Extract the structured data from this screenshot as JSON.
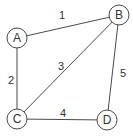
{
  "diagram": {
    "type": "weighted-undirected-graph",
    "stroke_color": "#4a4a4a",
    "node_fill": "#ffffff",
    "nodes": [
      {
        "id": "A",
        "label": "A",
        "x": 17,
        "y": 38
      },
      {
        "id": "B",
        "label": "B",
        "x": 119,
        "y": 15
      },
      {
        "id": "C",
        "label": "C",
        "x": 17,
        "y": 119
      },
      {
        "id": "D",
        "label": "D",
        "x": 107,
        "y": 120
      }
    ],
    "edges": [
      {
        "from": "A",
        "to": "B",
        "weight": "1",
        "label_x": 62,
        "label_y": 19
      },
      {
        "from": "A",
        "to": "C",
        "weight": "2",
        "label_x": 11,
        "label_y": 84
      },
      {
        "from": "B",
        "to": "C",
        "weight": "3",
        "label_x": 61,
        "label_y": 70
      },
      {
        "from": "C",
        "to": "D",
        "weight": "4",
        "label_x": 63,
        "label_y": 117
      },
      {
        "from": "B",
        "to": "D",
        "weight": "5",
        "label_x": 123,
        "label_y": 77
      }
    ]
  }
}
